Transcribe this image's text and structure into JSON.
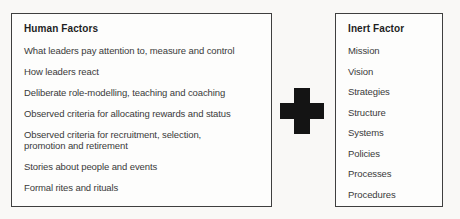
{
  "left_panel": {
    "title": "Human Factors",
    "items": [
      "What leaders pay attention to, measure and control",
      "How leaders react",
      "Deliberate role-modelling, teaching and coaching",
      "Observed criteria for allocating rewards and status",
      "Observed criteria for recruitment, selection,\npromotion and retirement",
      "Stories about people and events",
      "Formal rites and rituals"
    ]
  },
  "operator": {
    "symbol": "+",
    "meaning": "plus",
    "color": "#141414"
  },
  "right_panel": {
    "title": "Inert Factor",
    "items": [
      "Mission",
      "Vision",
      "Strategies",
      "Structure",
      "Systems",
      "Policies",
      "Processes",
      "Procedures"
    ]
  },
  "colors": {
    "background": "#f9f8f6",
    "panel_background": "#fdfdfc",
    "panel_border": "#3f3f3f",
    "title_text": "#1f1f1f",
    "body_text": "#3a3a3a"
  }
}
